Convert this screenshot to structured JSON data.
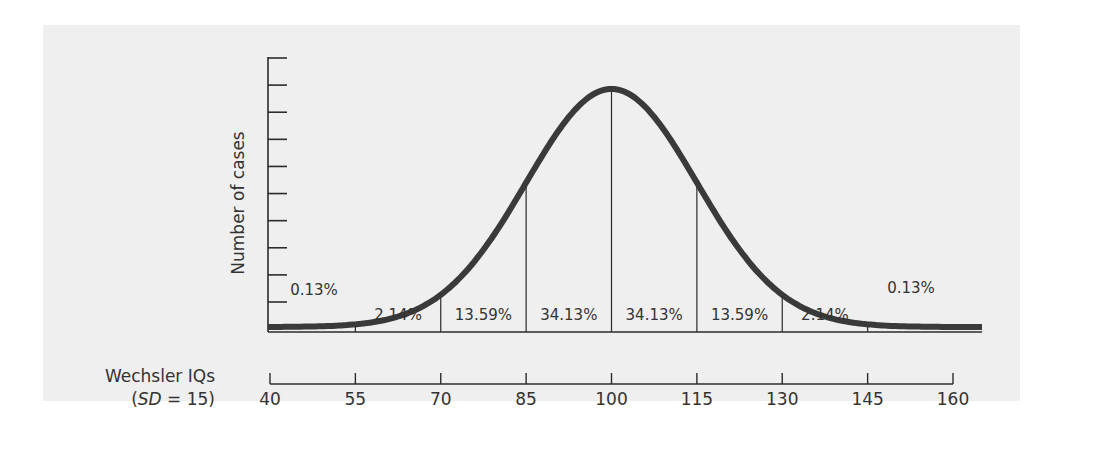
{
  "chart_data": {
    "type": "area",
    "title": "",
    "xlabel": "Wechsler IQs",
    "xlabel_sub": "(SD = 15)",
    "ylabel": "Number of cases",
    "x_ticks": [
      40,
      55,
      70,
      85,
      100,
      115,
      130,
      145,
      160
    ],
    "xlim": [
      40,
      160
    ],
    "y_tick_count": 10,
    "distribution": {
      "kind": "normal",
      "mean": 100,
      "sd": 15
    },
    "regions": [
      {
        "from": 40,
        "to": 55,
        "percent": "0.13%"
      },
      {
        "from": 55,
        "to": 70,
        "percent": "2.14%"
      },
      {
        "from": 70,
        "to": 85,
        "percent": "13.59%"
      },
      {
        "from": 85,
        "to": 100,
        "percent": "34.13%"
      },
      {
        "from": 100,
        "to": 115,
        "percent": "34.13%"
      },
      {
        "from": 115,
        "to": 130,
        "percent": "13.59%"
      },
      {
        "from": 130,
        "to": 145,
        "percent": "2.14%"
      },
      {
        "from": 145,
        "to": 160,
        "percent": "0.13%"
      }
    ],
    "grid": false,
    "legend": null
  },
  "labels": {
    "y_axis": "Number of cases",
    "x_axis_line1": "Wechsler IQs",
    "x_axis_sd_italic": "SD",
    "x_axis_sd_rest": " = 15)",
    "x_axis_sd_open": "("
  },
  "colors": {
    "panel": "#efefef",
    "curve": "#3a3a3a",
    "lines": "#2b2b2b",
    "text": "#333333"
  }
}
